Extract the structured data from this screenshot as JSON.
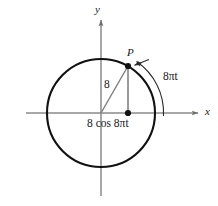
{
  "figure": {
    "type": "diagram",
    "background_color": "#ffffff",
    "stroke_color_primary": "#111111",
    "stroke_color_axis": "#8a8a8a",
    "stroke_color_thin": "#7d7d7d"
  },
  "axes": {
    "x_label": "x",
    "y_label": "y",
    "origin": {
      "x": 101,
      "y": 113
    },
    "x_axis": {
      "start_x": 26,
      "end_x": 200,
      "y": 113,
      "arrow": "right"
    },
    "y_axis": {
      "start_y": 18,
      "end_y": 196,
      "x": 101,
      "arrow": "up"
    }
  },
  "circle": {
    "center_x": 101,
    "center_y": 113,
    "radius": 54,
    "stroke_width": 2.1,
    "color": "#111111"
  },
  "point": {
    "label": "P",
    "x": 128,
    "y": 66,
    "dot_radius": 3.1
  },
  "projection_point": {
    "x": 128,
    "y": 113,
    "dot_radius": 3.1
  },
  "segments": {
    "radius": {
      "label": "8",
      "from_x": 101,
      "from_y": 113,
      "to_x": 128,
      "to_y": 66
    },
    "vertical_drop": {
      "from_x": 128,
      "from_y": 66,
      "to_x": 128,
      "to_y": 113
    }
  },
  "labels": {
    "radius_length": "8",
    "x_projection": "8 cos 8πt",
    "angle": "8πt",
    "point_name": "P",
    "axis_x": "x",
    "axis_y": "y"
  },
  "angle_arc": {
    "label": "8πt",
    "center_x": 101,
    "center_y": 113,
    "radius": 62,
    "start_angle_deg": 0,
    "end_angle_deg": 60,
    "arrow_at": "end",
    "direction": "counterclockwise"
  },
  "pointer_arrow": {
    "from_x": 147,
    "from_y": 60,
    "to_x": 132,
    "to_y": 66,
    "target": "P"
  }
}
